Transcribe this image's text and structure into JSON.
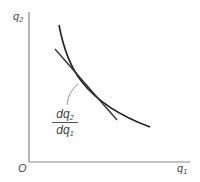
{
  "diagram": {
    "y_axis_label": {
      "base": "q",
      "sub": "2"
    },
    "x_axis_label": {
      "base": "q",
      "sub": "1"
    },
    "origin_label": "O",
    "slope_label": {
      "numerator_base": "dq",
      "numerator_sub": "2",
      "denominator_base": "dq",
      "denominator_sub": "1"
    },
    "colors": {
      "axis": "#888888",
      "curve": "#222222",
      "tangent": "#333333",
      "leader": "#888888",
      "text": "#444444"
    }
  }
}
